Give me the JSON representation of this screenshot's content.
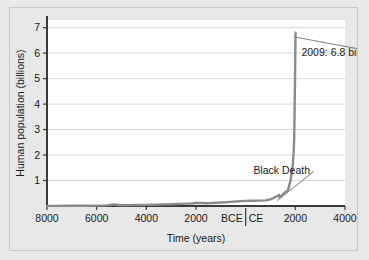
{
  "figure": {
    "background_color": "#e8e8e8",
    "plot_background_color": "#ffffff",
    "border_color": "#c9c9c9"
  },
  "chart_data": {
    "type": "line",
    "title": "",
    "xlabel": "Time (years)",
    "ylabel": "Human population (billions)",
    "xlim": [
      -8000,
      4000
    ],
    "ylim": [
      0,
      7.3
    ],
    "grid": true,
    "grid_axis": "y",
    "legend": false,
    "legend_position": "none",
    "line_color": "#8b8b8b",
    "axis_color": "#3a3a3a",
    "grid_color": "#cfcfcf",
    "text_color": "#1a1a1a",
    "xticks": [
      -8000,
      -6000,
      -4000,
      -2000,
      0,
      2000,
      4000
    ],
    "xticklabels": [
      "8000",
      "6000",
      "4000",
      "2000",
      "BCE|CE",
      "2000",
      "4000"
    ],
    "xtick_era_left": "BCE",
    "xtick_era_right": "CE",
    "yticks": [
      1,
      2,
      3,
      4,
      5,
      6,
      7
    ],
    "yticklabels": [
      "1",
      "2",
      "3",
      "4",
      "5",
      "6",
      "7"
    ],
    "annotations": [
      {
        "name": "peak-annotation",
        "text": "2009: 6.8 billion",
        "x": 2009,
        "y": 6.8,
        "label_x": 365,
        "label_y": 5.9
      },
      {
        "name": "black-death-annotation",
        "text": "Black Death",
        "x": 1350,
        "y": 0.37,
        "label_x": 300,
        "label_y": 1.25
      }
    ],
    "x": [
      -8000,
      -7600,
      -7200,
      -6800,
      -6400,
      -6000,
      -5600,
      -5400,
      -5300,
      -5200,
      -5100,
      -5000,
      -4800,
      -4600,
      -4400,
      -4200,
      -4000,
      -3800,
      -3600,
      -3400,
      -3200,
      -3000,
      -2800,
      -2600,
      -2400,
      -2200,
      -2000,
      -1800,
      -1600,
      -1400,
      -1200,
      -1000,
      -800,
      -600,
      -400,
      -200,
      0,
      200,
      400,
      600,
      800,
      1000,
      1100,
      1200,
      1300,
      1340,
      1350,
      1360,
      1400,
      1500,
      1600,
      1700,
      1750,
      1800,
      1850,
      1900,
      1927,
      1950,
      1960,
      1974,
      1987,
      1999,
      2009
    ],
    "y": [
      0.005,
      0.006,
      0.008,
      0.01,
      0.012,
      0.015,
      0.025,
      0.05,
      0.065,
      0.05,
      0.035,
      0.03,
      0.032,
      0.035,
      0.038,
      0.042,
      0.045,
      0.05,
      0.055,
      0.06,
      0.065,
      0.07,
      0.078,
      0.085,
      0.092,
      0.1,
      0.12,
      0.115,
      0.11,
      0.115,
      0.125,
      0.135,
      0.145,
      0.16,
      0.175,
      0.19,
      0.2,
      0.21,
      0.205,
      0.21,
      0.22,
      0.265,
      0.3,
      0.36,
      0.4,
      0.44,
      0.38,
      0.35,
      0.37,
      0.46,
      0.55,
      0.6,
      0.79,
      0.98,
      1.26,
      1.65,
      2.0,
      2.52,
      3.02,
      4.0,
      5.0,
      6.0,
      6.8
    ],
    "series_name": "Human population"
  }
}
